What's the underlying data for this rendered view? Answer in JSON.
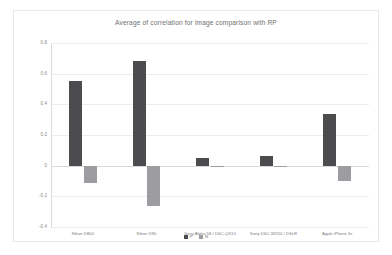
{
  "chart_data": {
    "type": "bar",
    "title": "Average of correlation for image comparison with RP",
    "xlabel": "",
    "ylabel": "",
    "ylim": [
      -0.4,
      0.8
    ],
    "yticks": [
      "0.8",
      "0.6",
      "0.4",
      "0.2",
      "0",
      "-0.2",
      "-0.4"
    ],
    "ytick_values": [
      0.8,
      0.6,
      0.4,
      0.2,
      0,
      -0.2,
      -0.4
    ],
    "grid": true,
    "legend_position": "bottom",
    "categories": [
      "Nikon D800",
      "Nikon D90",
      "Sony Alpha 58 / DSC-QX10",
      "Sony DSC-WX10 / DSLR",
      "Apple iPhone 5s"
    ],
    "series": [
      {
        "name": "P",
        "values": [
          0.55,
          0.68,
          0.05,
          0.06,
          0.34
        ]
      },
      {
        "name": "N",
        "values": [
          -0.11,
          -0.26,
          0.0,
          -0.004,
          -0.1
        ]
      }
    ]
  },
  "chart": {
    "title": "Average of correlation for image comparison with RP",
    "colors": {
      "series_0": "#4c4c4f",
      "series_1": "#9d9da1",
      "grid": "#ececee",
      "axis": "#d9d9dc",
      "text": "#7a7a7e",
      "border": "#e8e8ea"
    }
  }
}
